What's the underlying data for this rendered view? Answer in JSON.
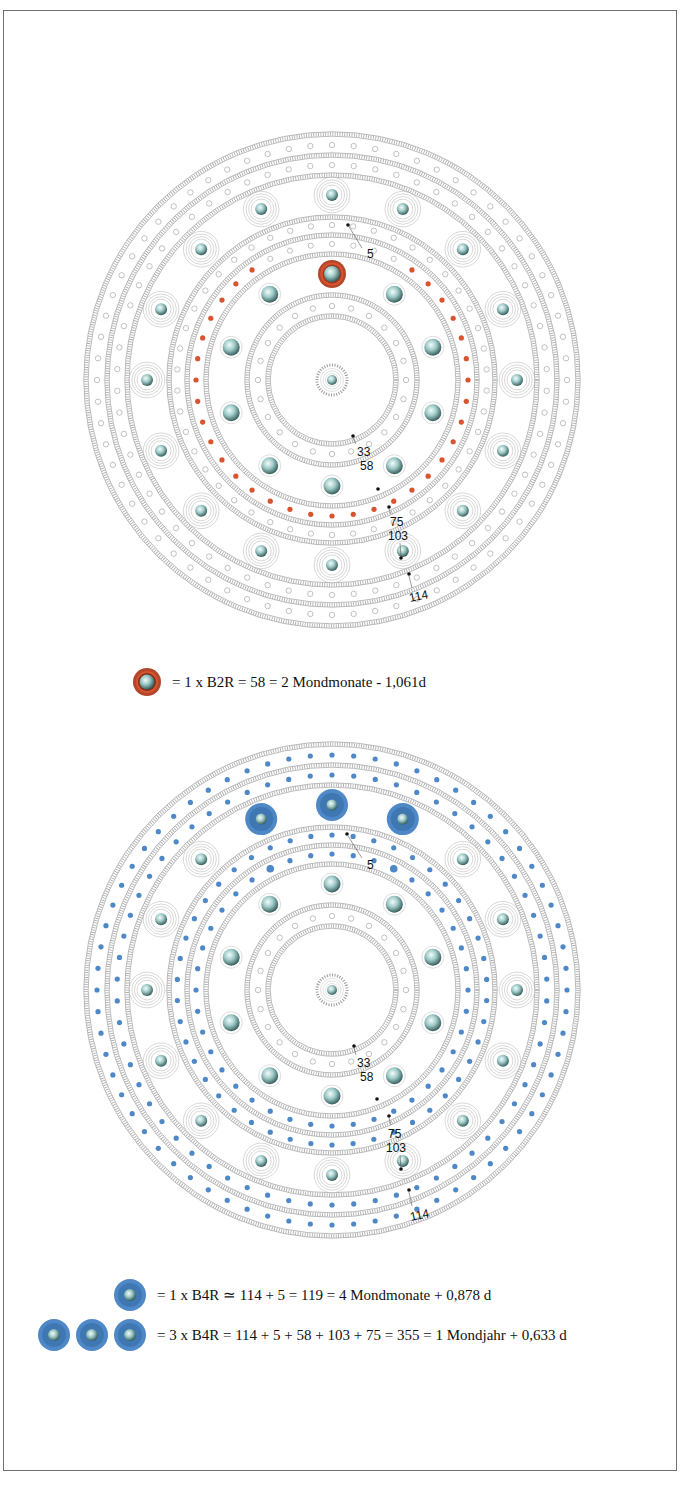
{
  "colors": {
    "frame": "#6f6f6f",
    "hatch": "#8d8d8d",
    "hollow_dot": "#a8a8a8",
    "red": "#d9532e",
    "red_dark": "#9a3a22",
    "blue": "#4f88c6",
    "blue_dark": "#2f6aa8",
    "boss_light": "#dff0ee",
    "boss_dark": "#3e6a68"
  },
  "diagrams": [
    {
      "id": "top",
      "center": [
        332,
        280
      ],
      "fill_color": "red",
      "rings": {
        "hatched_radii": [
          246,
          225,
          205,
          163,
          145,
          126,
          85,
          64
        ],
        "dot_rings": [
          {
            "r": 235,
            "count": 68,
            "style": "hollow"
          },
          {
            "r": 215,
            "count": 62,
            "style": "hollow"
          },
          {
            "r": 155,
            "count": 46,
            "style": "hollow"
          },
          {
            "r": 136,
            "count": 40,
            "style": "red",
            "gap_deg": 30,
            "gap_end_large": true
          },
          {
            "r": 74,
            "count": 24,
            "style": "hollow"
          }
        ],
        "outer_bosses": {
          "r": 185,
          "count": 16,
          "highlight": []
        },
        "inner_bosses": {
          "r": 106,
          "count": 10,
          "highlight": [
            0
          ]
        }
      },
      "labels": [
        {
          "text": "5",
          "x": 367,
          "y": 158,
          "lx1": 348,
          "ly1": 125,
          "lx2": 362,
          "ly2": 148,
          "dot": [
            348,
            125
          ]
        },
        {
          "text": "33",
          "x": 357,
          "y": 356,
          "lx1": 353,
          "ly1": 338,
          "lx2": 356,
          "ly2": 344,
          "dot": [
            353,
            336
          ]
        },
        {
          "text": "58",
          "x": 360,
          "y": 370,
          "dot": [
            378,
            389
          ]
        },
        {
          "text": "75",
          "x": 390,
          "y": 426,
          "lx1": 389,
          "ly1": 409,
          "lx2": 391,
          "ly2": 414,
          "dot": [
            389,
            407
          ]
        },
        {
          "text": "103",
          "x": 388,
          "y": 440,
          "lx1": 400,
          "ly1": 443,
          "lx2": 401,
          "ly2": 456,
          "dot": [
            401,
            458
          ]
        },
        {
          "text": "114",
          "x": 410,
          "y": 502,
          "lx1": 409,
          "ly1": 476,
          "lx2": 412,
          "ly2": 488,
          "dot": [
            409,
            474
          ],
          "rotate": -12
        }
      ]
    },
    {
      "id": "bottom",
      "center": [
        332,
        280
      ],
      "fill_color": "blue",
      "rings": {
        "hatched_radii": [
          246,
          225,
          205,
          163,
          145,
          126,
          85,
          64
        ],
        "dot_rings": [
          {
            "r": 235,
            "count": 68,
            "style": "blue"
          },
          {
            "r": 215,
            "count": 62,
            "style": "blue"
          },
          {
            "r": 155,
            "count": 46,
            "style": "blue"
          },
          {
            "r": 136,
            "count": 40,
            "style": "blue",
            "gap_deg": 0,
            "gap_end_large": true
          },
          {
            "r": 74,
            "count": 24,
            "style": "hollow"
          }
        ],
        "outer_bosses": {
          "r": 185,
          "count": 16,
          "highlight": [
            15,
            0,
            1
          ]
        },
        "inner_bosses": {
          "r": 106,
          "count": 10,
          "highlight": []
        }
      },
      "labels": [
        {
          "text": "5",
          "x": 367,
          "y": 159,
          "lx1": 348,
          "ly1": 126,
          "lx2": 362,
          "ly2": 148,
          "dot": [
            347,
            124
          ]
        },
        {
          "text": "33",
          "x": 357,
          "y": 357,
          "lx1": 354,
          "ly1": 338,
          "lx2": 356,
          "ly2": 345,
          "dot": [
            354,
            336
          ]
        },
        {
          "text": "58",
          "x": 360,
          "y": 371,
          "dot": [
            377,
            389
          ]
        },
        {
          "text": "75",
          "x": 388,
          "y": 428,
          "lx1": 389,
          "ly1": 408,
          "lx2": 391,
          "ly2": 415,
          "dot": [
            389,
            406
          ]
        },
        {
          "text": "103",
          "x": 386,
          "y": 442,
          "lx1": 400,
          "ly1": 445,
          "lx2": 401,
          "ly2": 458,
          "dot": [
            401,
            459
          ]
        },
        {
          "text": "114",
          "x": 411,
          "y": 511,
          "lx1": 409,
          "ly1": 482,
          "lx2": 412,
          "ly2": 496,
          "dot": [
            409,
            480
          ],
          "rotate": -12
        }
      ]
    }
  ],
  "legend": {
    "top": {
      "icon": "red-ringed-boss",
      "text": "=  1 x   B2R =   58 = 2 Mondmonate - 1,061d"
    },
    "bottom_1": {
      "icon": "blue-boss",
      "count": 1,
      "text": "= 1 x B4R ≃ 114 + 5  = 119 = 4 Mondmonate + 0,878 d"
    },
    "bottom_2": {
      "icon": "blue-boss",
      "count": 3,
      "text": "= 3 x B4R = 114 + 5 + 58 + 103 + 75 = 355 = 1 Mondjahr + 0,633 d"
    }
  }
}
